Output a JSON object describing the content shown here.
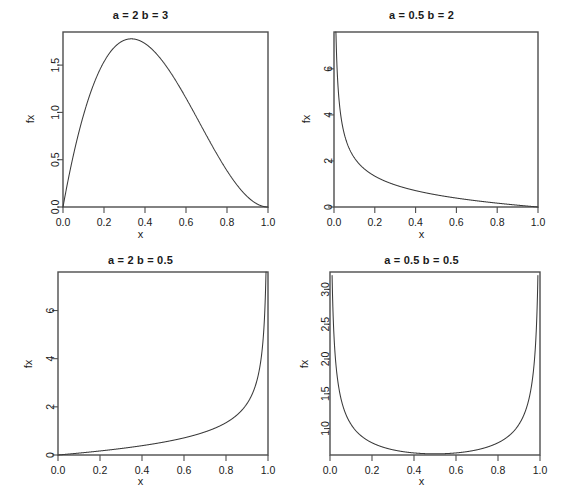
{
  "figure": {
    "background_color": "#ffffff",
    "line_color": "#3a3a3a",
    "axis_color": "#4d4d4d",
    "text_color": "#1a1a1a",
    "layout": "2x2 grid of Beta probability density function plots"
  },
  "chart_data": [
    {
      "type": "line",
      "title": "a = 2 b = 3",
      "xlabel": "x",
      "ylabel": "fx",
      "distribution": "beta",
      "a": 2,
      "b": 3,
      "xlim": [
        0,
        1
      ],
      "ylim": [
        0,
        1.85
      ],
      "xticks": [
        0.0,
        0.2,
        0.4,
        0.6,
        0.8,
        1.0
      ],
      "xticklabels": [
        "0.0",
        "0.2",
        "0.4",
        "0.6",
        "0.8",
        "1.0"
      ],
      "yticks": [
        0.0,
        0.5,
        1.0,
        1.5
      ],
      "yticklabels": [
        "0.0",
        "0.5",
        "1.0",
        "1.5"
      ],
      "grid": false,
      "legend": "none",
      "x": [
        0.001,
        0.02,
        0.04,
        0.06,
        0.08,
        0.1,
        0.12,
        0.14,
        0.16,
        0.18,
        0.2,
        0.22,
        0.24,
        0.26,
        0.28,
        0.3,
        0.3333,
        0.36,
        0.4,
        0.44,
        0.48,
        0.52,
        0.56,
        0.6,
        0.64,
        0.68,
        0.72,
        0.76,
        0.8,
        0.84,
        0.88,
        0.92,
        0.96,
        0.99,
        1.0
      ],
      "y": [
        0.012,
        0.2304,
        0.4424,
        0.636,
        0.8122,
        0.972,
        1.1162,
        1.2458,
        1.3617,
        1.4648,
        1.536,
        1.6352,
        1.7033,
        1.7611,
        1.8093,
        1.8487,
        1.7778,
        1.7694,
        1.728,
        1.6594,
        1.5674,
        1.4555,
        1.3275,
        1.1873,
        1.0386,
        0.8851,
        0.7306,
        0.5788,
        0.4335,
        0.2984,
        0.1772,
        0.0736,
        0.0116,
        0.0004,
        0.0
      ],
      "note": "Beta(2,3) density f(x)=12x(1-x)^2; unimodal, mode at x=1/3, peak 1.778"
    },
    {
      "type": "line",
      "title": "a = 0.5 b = 2",
      "xlabel": "x",
      "ylabel": "fx",
      "distribution": "beta",
      "a": 0.5,
      "b": 2,
      "xlim": [
        0,
        1
      ],
      "ylim": [
        0,
        7.6
      ],
      "xticks": [
        0.0,
        0.2,
        0.4,
        0.6,
        0.8,
        1.0
      ],
      "xticklabels": [
        "0.0",
        "0.2",
        "0.4",
        "0.6",
        "0.8",
        "1.0"
      ],
      "yticks": [
        0,
        2,
        4,
        6
      ],
      "yticklabels": [
        "0",
        "2",
        "4",
        "6"
      ],
      "grid": false,
      "legend": "none",
      "x": [
        0.005,
        0.01,
        0.02,
        0.03,
        0.05,
        0.07,
        0.1,
        0.13,
        0.16,
        0.2,
        0.25,
        0.3,
        0.35,
        0.4,
        0.45,
        0.5,
        0.55,
        0.6,
        0.65,
        0.7,
        0.75,
        0.8,
        0.85,
        0.9,
        0.95,
        0.99,
        1.0
      ],
      "y": [
        7.5,
        6.52,
        4.5,
        3.62,
        2.71,
        2.2,
        1.74,
        1.46,
        1.27,
        1.07,
        0.88,
        0.73,
        0.62,
        0.52,
        0.44,
        0.38,
        0.32,
        0.26,
        0.21,
        0.17,
        0.13,
        0.1,
        0.07,
        0.04,
        0.02,
        0.001,
        0.0
      ],
      "note": "Beta(0.5,2) density; decreasing, unbounded spike at x=0"
    },
    {
      "type": "line",
      "title": "a = 2 b = 0.5",
      "xlabel": "x",
      "ylabel": "fx",
      "distribution": "beta",
      "a": 2,
      "b": 0.5,
      "xlim": [
        0,
        1
      ],
      "ylim": [
        0,
        7.6
      ],
      "xticks": [
        0.0,
        0.2,
        0.4,
        0.6,
        0.8,
        1.0
      ],
      "xticklabels": [
        "0.0",
        "0.2",
        "0.4",
        "0.6",
        "0.8",
        "1.0"
      ],
      "yticks": [
        0,
        2,
        4,
        6
      ],
      "yticklabels": [
        "0",
        "2",
        "4",
        "6"
      ],
      "grid": false,
      "legend": "none",
      "x": [
        0.0,
        0.01,
        0.05,
        0.1,
        0.15,
        0.2,
        0.25,
        0.3,
        0.35,
        0.4,
        0.45,
        0.5,
        0.55,
        0.6,
        0.65,
        0.7,
        0.75,
        0.8,
        0.85,
        0.87,
        0.9,
        0.93,
        0.95,
        0.97,
        0.98,
        0.99,
        0.995
      ],
      "y": [
        0.0,
        0.001,
        0.02,
        0.04,
        0.07,
        0.1,
        0.13,
        0.17,
        0.21,
        0.26,
        0.32,
        0.38,
        0.44,
        0.52,
        0.62,
        0.73,
        0.88,
        1.07,
        1.32,
        1.45,
        1.71,
        2.09,
        2.47,
        3.2,
        3.85,
        5.07,
        7.4
      ],
      "note": "Beta(2,0.5) density; increasing, unbounded spike at x=1 (mirror of panel 2)"
    },
    {
      "type": "line",
      "title": "a = 0.5 b = 0.5",
      "xlabel": "x",
      "ylabel": "fx",
      "distribution": "beta",
      "a": 0.5,
      "b": 0.5,
      "xlim": [
        0,
        1
      ],
      "ylim": [
        0.62,
        3.25
      ],
      "xticks": [
        0.0,
        0.2,
        0.4,
        0.6,
        0.8,
        1.0
      ],
      "xticklabels": [
        "0.0",
        "0.2",
        "0.4",
        "0.6",
        "0.8",
        "1.0"
      ],
      "yticks": [
        1.0,
        1.5,
        2.0,
        2.5,
        3.0
      ],
      "yticklabels": [
        "1.0",
        "1.5",
        "2.0",
        "2.5",
        "3.0"
      ],
      "grid": false,
      "legend": "none",
      "x": [
        0.01,
        0.015,
        0.02,
        0.03,
        0.04,
        0.06,
        0.08,
        0.1,
        0.13,
        0.16,
        0.2,
        0.25,
        0.3,
        0.35,
        0.4,
        0.45,
        0.5,
        0.55,
        0.6,
        0.65,
        0.7,
        0.75,
        0.8,
        0.84,
        0.87,
        0.9,
        0.92,
        0.94,
        0.96,
        0.97,
        0.98,
        0.985,
        0.99
      ],
      "y": [
        3.2,
        2.62,
        2.27,
        1.86,
        1.62,
        1.34,
        1.18,
        1.06,
        0.95,
        0.87,
        0.8,
        0.735,
        0.695,
        0.67,
        0.65,
        0.643,
        0.637,
        0.643,
        0.65,
        0.67,
        0.695,
        0.735,
        0.8,
        0.87,
        0.95,
        1.06,
        1.18,
        1.34,
        1.62,
        1.86,
        2.27,
        2.62,
        3.2
      ],
      "note": "Beta(0.5,0.5) arcsine density; U-shaped, symmetric, minimum 0.637 at x=0.5"
    }
  ]
}
